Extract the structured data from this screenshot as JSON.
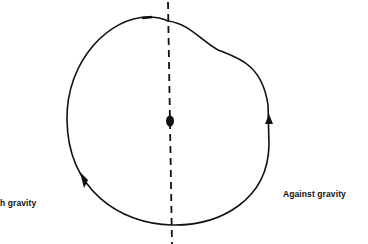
{
  "diagram": {
    "labels": {
      "left": "With gravity",
      "left_visible": "th gravity",
      "right": "Against gravity"
    },
    "elements": {
      "axis": "vertical dashed line through center",
      "center": "filled dot (pivot)",
      "path": "closed loop with bulge on upper right",
      "arrows": [
        "downward arrow on left side",
        "upward arrow on right side"
      ]
    },
    "colors": {
      "stroke": "#111111",
      "background": "#ffffff"
    }
  }
}
